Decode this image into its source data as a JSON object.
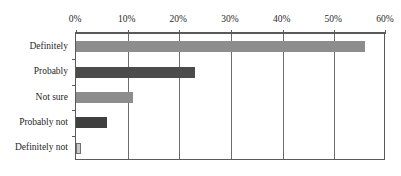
{
  "chart_data": {
    "type": "bar",
    "orientation": "horizontal",
    "title": "",
    "subtitle": "",
    "xlabel": "",
    "ylabel": "",
    "categories": [
      "Definitely",
      "Probably",
      "Not sure",
      "Probably not",
      "Definitely not"
    ],
    "values": [
      56,
      23,
      11,
      6,
      1
    ],
    "value_unit": "%",
    "xlim": [
      0,
      60
    ],
    "xticks": [
      0,
      10,
      20,
      30,
      40,
      50,
      60
    ],
    "xtick_labels": [
      "0%",
      "10%",
      "20%",
      "30%",
      "40%",
      "50%",
      "60%"
    ],
    "grid": "vertical",
    "legend": "none",
    "axis_position": "top",
    "bar_colors": [
      "#8d8d8d",
      "#4b4b4b",
      "#8d8d8d",
      "#3f3f3f",
      "#c9c9c9"
    ],
    "series": [
      {
        "name": "Response share",
        "values": [
          56,
          23,
          11,
          6,
          1
        ]
      }
    ],
    "points": [
      {
        "category": "Definitely",
        "value": 56,
        "label": "56%",
        "color": "#8d8d8d"
      },
      {
        "category": "Probably",
        "value": 23,
        "label": "23%",
        "color": "#4b4b4b"
      },
      {
        "category": "Not sure",
        "value": 11,
        "label": "11%",
        "color": "#8d8d8d"
      },
      {
        "category": "Probably not",
        "value": 6,
        "label": "6%",
        "color": "#3f3f3f"
      },
      {
        "category": "Definitely not",
        "value": 1,
        "label": "1%",
        "color": "#c9c9c9"
      }
    ]
  },
  "axis": {
    "tick_0": "0%",
    "tick_1": "10%",
    "tick_2": "20%",
    "tick_3": "30%",
    "tick_4": "40%",
    "tick_5": "50%",
    "tick_6": "60%"
  },
  "categories": {
    "cat_0": "Definitely",
    "cat_1": "Probably",
    "cat_2": "Not sure",
    "cat_3": "Probably not",
    "cat_4": "Definitely not"
  },
  "artifact": {
    "text": ""
  }
}
